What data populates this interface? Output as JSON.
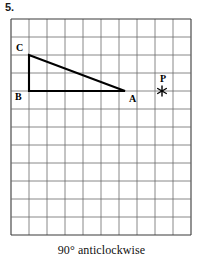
{
  "question": {
    "number": "5."
  },
  "caption": {
    "text": "90° anticlockwise"
  },
  "diagram": {
    "type": "geometry-grid",
    "grid": {
      "columns": 10,
      "rows": 12,
      "cell_size": 18,
      "origin_x": 11,
      "origin_y": 19,
      "line_color": "#6b6b6b",
      "border_color": "#3a3a3a"
    },
    "shape": {
      "name": "triangle-abc",
      "stroke_color": "#000000",
      "vertices": [
        {
          "label": "A",
          "x": 125,
          "y": 91,
          "label_x": 129,
          "label_y": 102
        },
        {
          "label": "B",
          "x": 29,
          "y": 91,
          "label_x": 15,
          "label_y": 100
        },
        {
          "label": "C",
          "x": 29,
          "y": 55,
          "label_x": 16,
          "label_y": 51
        }
      ]
    },
    "point": {
      "label": "P",
      "x": 162,
      "y": 91,
      "label_x": 160,
      "label_y": 82,
      "marker": "asterisk-marker",
      "color": "#000000"
    }
  }
}
